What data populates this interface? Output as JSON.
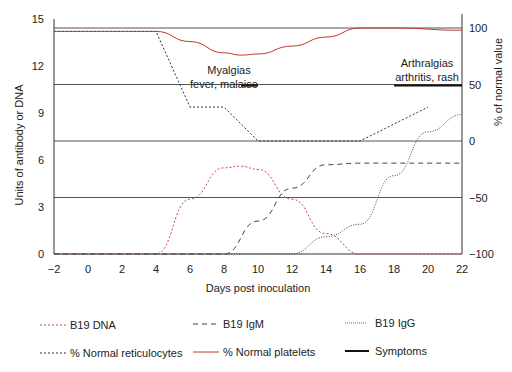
{
  "chart_data": {
    "type": "line",
    "title": "",
    "xlabel": "Days post inoculation",
    "ylabel": "Units of antibody or DNA",
    "ylabel_right": "% of normal value",
    "xlim": [
      -2,
      22
    ],
    "ylim": [
      0,
      15
    ],
    "ylim_right": [
      -100,
      100
    ],
    "x_ticks": [
      "−2",
      "0",
      "2",
      "4",
      "6",
      "8",
      "10",
      "12",
      "14",
      "16",
      "18",
      "20",
      "22"
    ],
    "y_ticks": [
      "0",
      "3",
      "6",
      "9",
      "12",
      "15"
    ],
    "y_ticks_right": [
      "−100",
      "−50",
      "0",
      "50",
      "100"
    ],
    "grid": "horizontal lines at right-axis 100, 50, 0, -50, -100",
    "series": [
      {
        "name": "B19 DNA",
        "axis": "left",
        "style": "dashed-fine",
        "color": "#c0504d",
        "x": [
          -2,
          4,
          6,
          8,
          9,
          10,
          12,
          14,
          16,
          22
        ],
        "values": [
          0,
          0,
          3.5,
          5.5,
          5.6,
          5.4,
          3.5,
          1.3,
          0,
          0
        ]
      },
      {
        "name": "B19 IgM",
        "axis": "left",
        "style": "dashed",
        "color": "#444444",
        "x": [
          -2,
          8,
          10,
          12,
          14,
          16,
          22
        ],
        "values": [
          0,
          0,
          2.1,
          4.2,
          5.7,
          5.8,
          5.8
        ]
      },
      {
        "name": "B19 IgG",
        "axis": "left",
        "style": "dotted",
        "color": "#444444",
        "x": [
          -2,
          12,
          14,
          16,
          18,
          20,
          22
        ],
        "values": [
          0,
          0,
          1.1,
          1.9,
          5.0,
          7.8,
          8.9
        ]
      },
      {
        "name": "% Normal reticulocytes",
        "axis": "right",
        "style": "dashed-fine",
        "color": "#333333",
        "x": [
          -2,
          4,
          6,
          8,
          10,
          16,
          20
        ],
        "values": [
          97,
          97,
          30,
          30,
          0,
          0,
          30
        ]
      },
      {
        "name": "% Normal platelets",
        "axis": "right",
        "style": "solid",
        "color": "#c0392b",
        "x": [
          -2,
          4,
          6,
          8,
          9,
          10,
          12,
          14,
          16,
          18,
          22
        ],
        "values": [
          97,
          97,
          88,
          78,
          76,
          77,
          84,
          92,
          100,
          100,
          98
        ]
      },
      {
        "name": "Symptoms",
        "axis": "right",
        "style": "solid-thick",
        "color": "#111111",
        "segments": [
          {
            "x": [
              9,
              10
            ],
            "y": 50,
            "label": "Myalgias fever, malaise"
          },
          {
            "x": [
              18,
              22
            ],
            "y": 50,
            "label": "Arthralgias arthritis, rash"
          }
        ]
      }
    ],
    "annotations": [
      {
        "text_line1": "Myalgias",
        "text_line2": "fever, malaise",
        "x": 10
      },
      {
        "text_line1": "Arthralgias",
        "text_line2": "arthritis, rash",
        "x": 20
      }
    ],
    "legend_position": "bottom"
  },
  "legend": [
    {
      "label": "B19 DNA",
      "style": "dashed-fine",
      "color": "#c0504d"
    },
    {
      "label": "B19 IgM",
      "style": "dashed",
      "color": "#444444"
    },
    {
      "label": "B19 IgG",
      "style": "dotted",
      "color": "#444444"
    },
    {
      "label": "% Normal reticulocytes",
      "style": "dashed-fine",
      "color": "#333333"
    },
    {
      "label": "% Normal platelets",
      "style": "solid",
      "color": "#c0392b"
    },
    {
      "label": "Symptoms",
      "style": "solid-thick",
      "color": "#111111"
    }
  ]
}
